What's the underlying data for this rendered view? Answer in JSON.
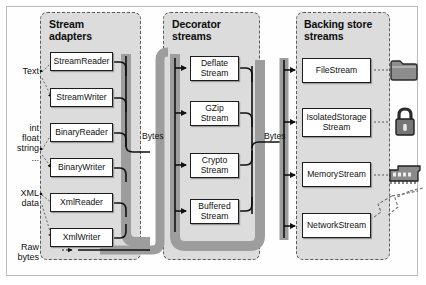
{
  "diagram": {
    "columns": [
      {
        "id": "stream-adapters",
        "title_line1": "Stream",
        "title_line2": "adapters",
        "nodes": [
          {
            "id": "streamreader",
            "label": "StreamReader"
          },
          {
            "id": "streamwriter",
            "label": "StreamWriter"
          },
          {
            "id": "binaryreader",
            "label": "BinaryReader"
          },
          {
            "id": "binarywriter",
            "label": "BinaryWriter"
          },
          {
            "id": "xmlreader",
            "label": "XmlReader"
          },
          {
            "id": "xmlwriter",
            "label": "XmlWriter"
          }
        ]
      },
      {
        "id": "decorator-streams",
        "title_line1": "Decorator",
        "title_line2": "streams",
        "nodes": [
          {
            "id": "deflatestream",
            "label": "Deflate\nStream",
            "l1": "Deflate",
            "l2": "Stream"
          },
          {
            "id": "gzipstream",
            "label": "GZip\nStream",
            "l1": "GZip",
            "l2": "Stream"
          },
          {
            "id": "cryptostream",
            "label": "Crypto\nStream",
            "l1": "Crypto",
            "l2": "Stream"
          },
          {
            "id": "bufferedstream",
            "label": "Buffered\nStream",
            "l1": "Buffered",
            "l2": "Stream"
          }
        ]
      },
      {
        "id": "backing-store-streams",
        "title_line1": "Backing store",
        "title_line2": "streams",
        "nodes": [
          {
            "id": "filestream",
            "l1": "FileStream",
            "l2": ""
          },
          {
            "id": "isolatedstoragestream",
            "l1": "IsolatedStorage",
            "l2": "Stream"
          },
          {
            "id": "memorystream",
            "l1": "MemoryStream",
            "l2": ""
          },
          {
            "id": "networkstream",
            "l1": "NetworkStream",
            "l2": ""
          }
        ]
      }
    ],
    "left_labels": [
      {
        "id": "text",
        "lines": [
          "Text"
        ]
      },
      {
        "id": "primitives",
        "lines": [
          "int",
          "float",
          "string",
          "..."
        ]
      },
      {
        "id": "xml-data",
        "lines": [
          "XML",
          "data"
        ]
      },
      {
        "id": "raw-bytes",
        "lines": [
          "Raw",
          "bytes"
        ]
      }
    ],
    "bus_labels": [
      {
        "id": "bytes-left",
        "text": "Bytes"
      },
      {
        "id": "bytes-right",
        "text": "Bytes"
      }
    ],
    "icons": [
      {
        "id": "folder-icon",
        "name": "folder-icon",
        "for": "filestream"
      },
      {
        "id": "lock-icon",
        "name": "lock-icon",
        "for": "isolatedstoragestream"
      },
      {
        "id": "memory-icon",
        "name": "memory-chip-icon",
        "for": "memorystream"
      },
      {
        "id": "network-icon",
        "name": "network-icon",
        "for": "networkstream"
      }
    ],
    "colors": {
      "panel_fill": "#dcdcdc",
      "panel_border": "#5a5a5a",
      "node_border": "#1d1d1d",
      "node_fill": "#ffffff",
      "icon_fill": "#7d7d7d",
      "frame": "#b9b9b9"
    }
  }
}
